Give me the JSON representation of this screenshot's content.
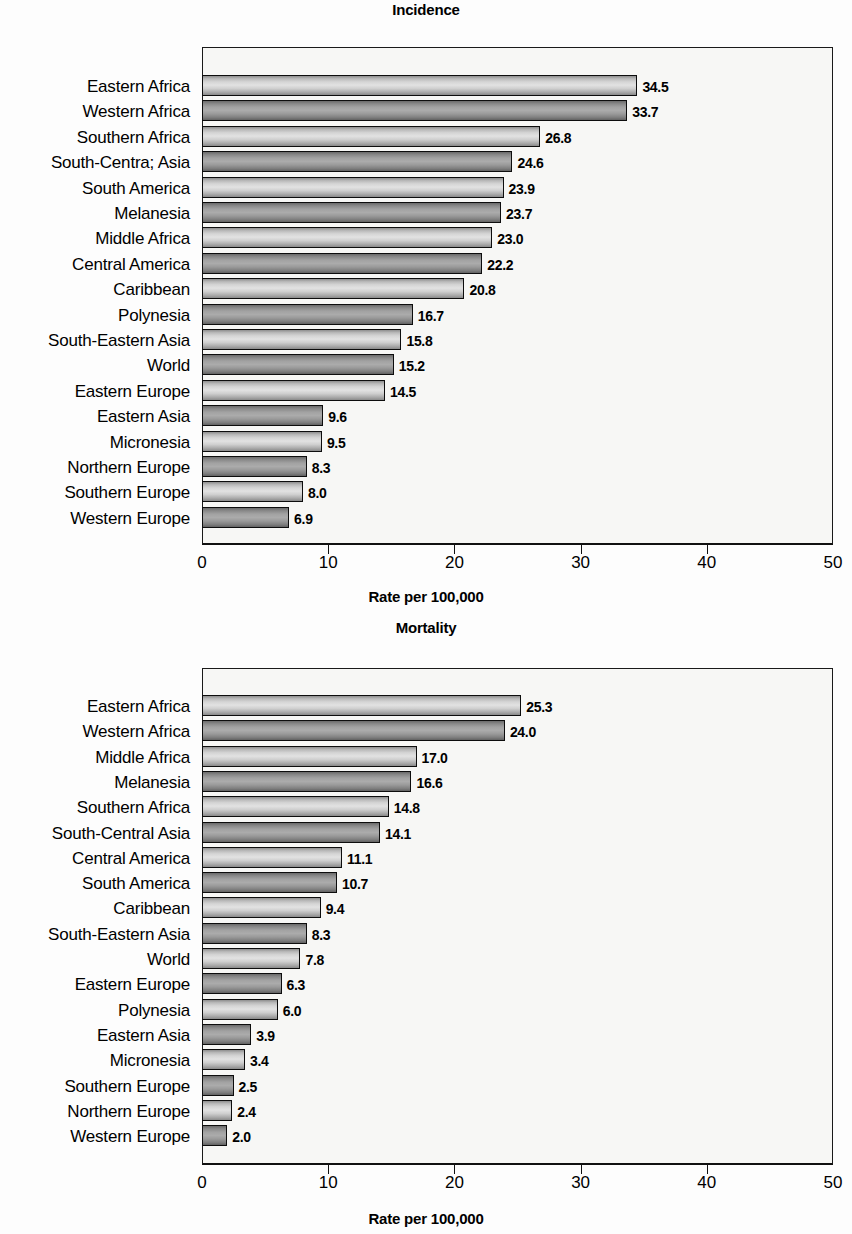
{
  "figure": {
    "panels": [
      "incidence",
      "mortality"
    ]
  },
  "chart_data": [
    {
      "type": "bar",
      "orientation": "horizontal",
      "title": "Incidence",
      "xlabel": "Rate per 100,000",
      "ylabel": "",
      "xlim": [
        0,
        50
      ],
      "xticks": [
        0,
        10,
        20,
        30,
        40,
        50
      ],
      "xtick_labels": [
        "0",
        "10",
        "20",
        "30",
        "40",
        "50"
      ],
      "grid": false,
      "legend": null,
      "categories": [
        "Eastern Africa",
        "Western Africa",
        "Southern Africa",
        "South-Centra; Asia",
        "South America",
        "Melanesia",
        "Middle Africa",
        "Central America",
        "Caribbean",
        "Polynesia",
        "South-Eastern Asia",
        "World",
        "Eastern Europe",
        "Eastern Asia",
        "Micronesia",
        "Northern Europe",
        "Southern Europe",
        "Western Europe"
      ],
      "values": [
        34.5,
        33.7,
        26.8,
        24.6,
        23.9,
        23.7,
        23.0,
        22.2,
        20.8,
        16.7,
        15.8,
        15.2,
        14.5,
        9.6,
        9.5,
        8.3,
        8.0,
        6.9
      ],
      "value_labels": [
        "34.5",
        "33.7",
        "26.8",
        "24.6",
        "23.9",
        "23.7",
        "23.0",
        "22.2",
        "20.8",
        "16.7",
        "15.8",
        "15.2",
        "14.5",
        "9.6",
        "9.5",
        "8.3",
        "8.0",
        "6.9"
      ]
    },
    {
      "type": "bar",
      "orientation": "horizontal",
      "title": "Mortality",
      "xlabel": "Rate per 100,000",
      "ylabel": "",
      "xlim": [
        0,
        50
      ],
      "xticks": [
        0,
        10,
        20,
        30,
        40,
        50
      ],
      "xtick_labels": [
        "0",
        "10",
        "20",
        "30",
        "40",
        "50"
      ],
      "grid": false,
      "legend": null,
      "categories": [
        "Eastern Africa",
        "Western Africa",
        "Middle Africa",
        "Melanesia",
        "Southern Africa",
        "South-Central Asia",
        "Central America",
        "South America",
        "Caribbean",
        "South-Eastern Asia",
        "World",
        "Eastern Europe",
        "Polynesia",
        "Eastern Asia",
        "Micronesia",
        "Southern Europe",
        "Northern Europe",
        "Western Europe"
      ],
      "values": [
        25.3,
        24.0,
        17.0,
        16.6,
        14.8,
        14.1,
        11.1,
        10.7,
        9.4,
        8.3,
        7.8,
        6.3,
        6.0,
        3.9,
        3.4,
        2.5,
        2.4,
        2.0
      ],
      "value_labels": [
        "25.3",
        "24.0",
        "17.0",
        "16.6",
        "14.8",
        "14.1",
        "11.1",
        "10.7",
        "9.4",
        "8.3",
        "7.8",
        "6.3",
        "6.0",
        "3.9",
        "3.4",
        "2.5",
        "2.4",
        "2.0"
      ]
    }
  ],
  "colors": {
    "bar_light": "#d4d4d4",
    "bar_dark": "#9a9a9a",
    "outline": "#0d0d0d",
    "plot_bg": "#f7f7f5",
    "text": "#000000"
  }
}
